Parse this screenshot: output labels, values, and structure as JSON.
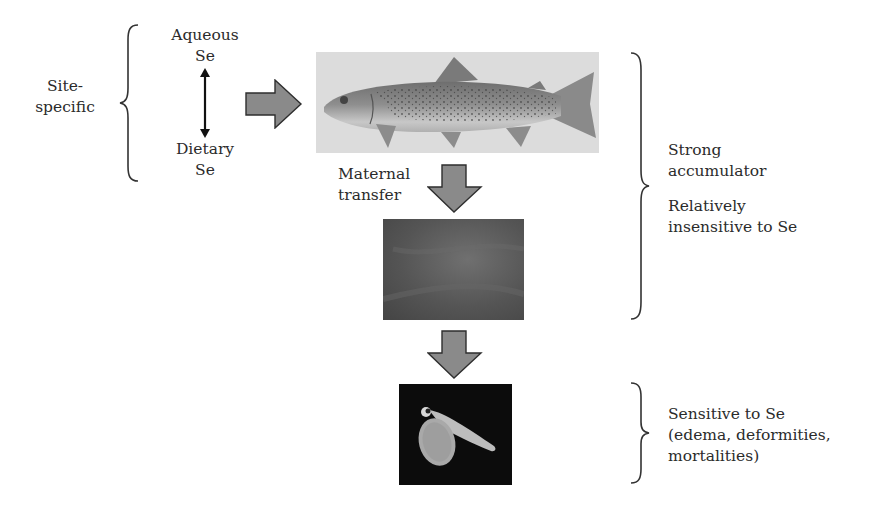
{
  "diagram": {
    "left_group": {
      "label_line1": "Site-",
      "label_line2": "specific",
      "aqueous_line1": "Aqueous",
      "aqueous_line2": "Se",
      "dietary_line1": "Dietary",
      "dietary_line2": "Se"
    },
    "stages": [
      {
        "name": "adult-fish",
        "image": "trout-illustration"
      },
      {
        "name": "eggs",
        "image": "fish-eggs-photo"
      },
      {
        "name": "larva",
        "image": "larval-fish-photo"
      }
    ],
    "arrows": {
      "maternal_line1": "Maternal",
      "maternal_line2": "transfer"
    },
    "adult_egg_notes": {
      "line1": "Strong",
      "line2": "accumulator",
      "line3": "Relatively",
      "line4": "insensitive to Se"
    },
    "larva_notes": {
      "line1": "Sensitive to Se",
      "line2": "(edema, deformities,",
      "line3": "mortalities)"
    },
    "colors": {
      "arrow_fill": "#8a8a8a",
      "arrow_stroke": "#2e2e2e",
      "text": "#2b2b2b",
      "egg_bg": "#5a5a5a",
      "larva_bg": "#0c0c0c"
    }
  }
}
